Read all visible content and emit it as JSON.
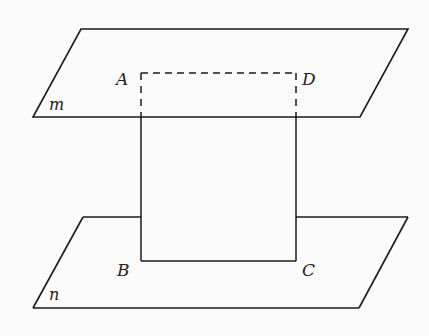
{
  "diagram": {
    "type": "geometry-two-parallel-planes-with-rectangle",
    "colors": {
      "background": "#fbfbfb",
      "stroke": "#1a1a1a"
    },
    "planes": [
      {
        "name": "m",
        "label": "m",
        "corners": [
          [
            81,
            29
          ],
          [
            408,
            29
          ],
          [
            360,
            117
          ],
          [
            33,
            117
          ]
        ],
        "label_pos": [
          49,
          110
        ]
      },
      {
        "name": "n",
        "label": "n",
        "corners": [
          [
            83,
            217
          ],
          [
            408,
            217
          ],
          [
            359,
            308
          ],
          [
            33,
            308
          ]
        ],
        "label_pos": [
          49,
          300
        ]
      }
    ],
    "points": [
      {
        "name": "A",
        "label": "A",
        "pos": [
          141,
          73
        ],
        "label_pos": [
          116,
          85
        ]
      },
      {
        "name": "D",
        "label": "D",
        "pos": [
          296,
          73
        ],
        "label_pos": [
          302,
          85
        ]
      },
      {
        "name": "B",
        "label": "B",
        "pos": [
          141,
          261
        ],
        "label_pos": [
          117,
          276
        ]
      },
      {
        "name": "C",
        "label": "C",
        "pos": [
          296,
          261
        ],
        "label_pos": [
          302,
          276
        ]
      }
    ],
    "segments": [
      {
        "from": "A",
        "to": "D",
        "style": "dashed",
        "note": "hidden, lies on plane m (visible part above plane m region)"
      },
      {
        "from": "A",
        "to": "B",
        "style": "dashed-then-solid",
        "dashed_until_y": 117
      },
      {
        "from": "D",
        "to": "C",
        "style": "dashed-then-solid",
        "dashed_until_y": 117
      },
      {
        "from": "B",
        "to": "C",
        "style": "solid"
      }
    ]
  }
}
